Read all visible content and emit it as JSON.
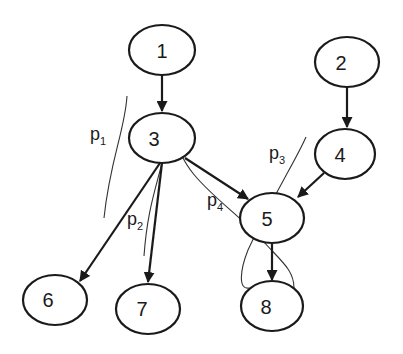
{
  "diagram": {
    "type": "directed-graph",
    "nodes": [
      {
        "id": "1",
        "label": "1"
      },
      {
        "id": "2",
        "label": "2"
      },
      {
        "id": "3",
        "label": "3"
      },
      {
        "id": "4",
        "label": "4"
      },
      {
        "id": "5",
        "label": "5"
      },
      {
        "id": "6",
        "label": "6"
      },
      {
        "id": "7",
        "label": "7"
      },
      {
        "id": "8",
        "label": "8"
      }
    ],
    "edges": [
      {
        "from": "1",
        "to": "3"
      },
      {
        "from": "2",
        "to": "4"
      },
      {
        "from": "3",
        "to": "5"
      },
      {
        "from": "4",
        "to": "5"
      },
      {
        "from": "3",
        "to": "6"
      },
      {
        "from": "3",
        "to": "7"
      },
      {
        "from": "5",
        "to": "8"
      }
    ],
    "paths": [
      {
        "id": "p1",
        "base": "p",
        "sub": "1"
      },
      {
        "id": "p2",
        "base": "p",
        "sub": "2"
      },
      {
        "id": "p3",
        "base": "p",
        "sub": "3"
      },
      {
        "id": "p4",
        "base": "p",
        "sub": "4"
      }
    ]
  }
}
